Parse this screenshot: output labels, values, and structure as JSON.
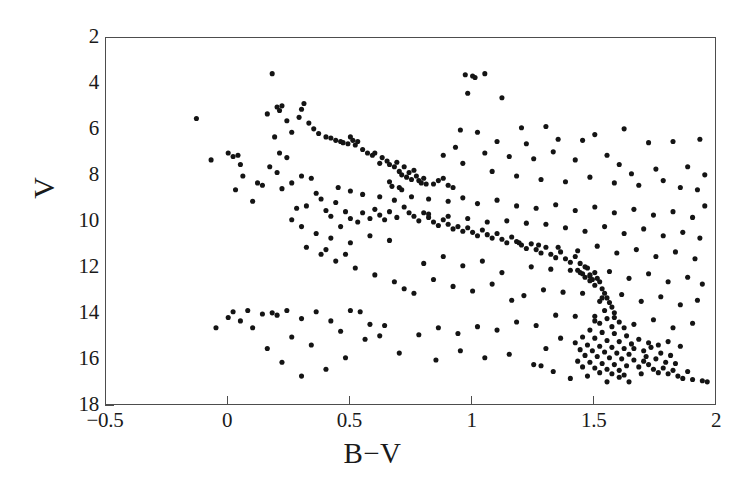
{
  "chart_data": {
    "type": "scatter",
    "title": "",
    "xlabel": "B−V",
    "ylabel": "V",
    "xlim": [
      -0.5,
      2.0
    ],
    "ylim": [
      18,
      2
    ],
    "y_inverted": true,
    "grid": false,
    "legend": null,
    "xticks": [
      -0.5,
      0,
      0.5,
      1,
      1.5,
      2
    ],
    "xticklabels": [
      "−0.5",
      "0",
      "0.5",
      "1",
      "1.5",
      "2"
    ],
    "yticks": [
      2,
      4,
      6,
      8,
      10,
      12,
      14,
      16,
      18
    ],
    "yticklabels": [
      "2",
      "4",
      "6",
      "8",
      "10",
      "12",
      "14",
      "16",
      "18"
    ],
    "marker": "filled-circle",
    "marker_color": "#141414",
    "marker_size_px": 4.4,
    "n_points": 392,
    "points": [
      [
        -0.13,
        5.5
      ],
      [
        -0.07,
        7.3
      ],
      [
        0.0,
        7.0
      ],
      [
        0.02,
        7.15
      ],
      [
        0.04,
        7.1
      ],
      [
        0.05,
        7.5
      ],
      [
        0.06,
        8.0
      ],
      [
        0.03,
        8.6
      ],
      [
        0.12,
        8.3
      ],
      [
        0.1,
        9.1
      ],
      [
        0.18,
        3.55
      ],
      [
        0.16,
        5.3
      ],
      [
        0.2,
        5.0
      ],
      [
        0.22,
        4.95
      ],
      [
        0.21,
        5.15
      ],
      [
        0.24,
        5.6
      ],
      [
        0.19,
        6.3
      ],
      [
        0.26,
        6.1
      ],
      [
        0.3,
        5.1
      ],
      [
        0.31,
        4.85
      ],
      [
        0.29,
        5.45
      ],
      [
        0.33,
        5.7
      ],
      [
        0.35,
        5.95
      ],
      [
        0.37,
        6.15
      ],
      [
        0.4,
        6.3
      ],
      [
        0.42,
        6.35
      ],
      [
        0.44,
        6.45
      ],
      [
        0.46,
        6.5
      ],
      [
        0.47,
        6.55
      ],
      [
        0.49,
        6.6
      ],
      [
        0.5,
        6.3
      ],
      [
        0.51,
        6.45
      ],
      [
        0.52,
        6.65
      ],
      [
        0.53,
        6.5
      ],
      [
        0.55,
        6.85
      ],
      [
        0.57,
        7.0
      ],
      [
        0.59,
        7.1
      ],
      [
        0.6,
        7.0
      ],
      [
        0.63,
        7.2
      ],
      [
        0.62,
        7.45
      ],
      [
        0.65,
        7.35
      ],
      [
        0.66,
        7.5
      ],
      [
        0.68,
        7.6
      ],
      [
        0.69,
        7.4
      ],
      [
        0.7,
        7.8
      ],
      [
        0.71,
        7.95
      ],
      [
        0.72,
        7.6
      ],
      [
        0.73,
        8.05
      ],
      [
        0.74,
        7.85
      ],
      [
        0.75,
        8.15
      ],
      [
        0.76,
        7.75
      ],
      [
        0.77,
        8.0
      ],
      [
        0.78,
        8.2
      ],
      [
        0.79,
        8.3
      ],
      [
        0.8,
        8.1
      ],
      [
        0.81,
        8.35
      ],
      [
        0.66,
        8.25
      ],
      [
        0.67,
        8.45
      ],
      [
        0.7,
        8.5
      ],
      [
        0.71,
        8.6
      ],
      [
        0.84,
        8.35
      ],
      [
        0.86,
        8.2
      ],
      [
        0.88,
        8.1
      ],
      [
        0.9,
        8.4
      ],
      [
        0.92,
        8.5
      ],
      [
        0.21,
        7.0
      ],
      [
        0.24,
        7.2
      ],
      [
        0.17,
        7.6
      ],
      [
        0.2,
        7.85
      ],
      [
        0.26,
        8.3
      ],
      [
        0.22,
        8.55
      ],
      [
        0.14,
        8.4
      ],
      [
        0.3,
        8.0
      ],
      [
        0.34,
        8.1
      ],
      [
        0.36,
        8.75
      ],
      [
        0.38,
        9.0
      ],
      [
        0.32,
        9.3
      ],
      [
        0.28,
        9.4
      ],
      [
        0.4,
        9.5
      ],
      [
        0.44,
        9.15
      ],
      [
        0.42,
        9.75
      ],
      [
        0.48,
        9.55
      ],
      [
        0.5,
        9.85
      ],
      [
        0.46,
        10.2
      ],
      [
        0.53,
        10.0
      ],
      [
        0.55,
        9.6
      ],
      [
        0.58,
        9.85
      ],
      [
        0.6,
        9.45
      ],
      [
        0.62,
        9.7
      ],
      [
        0.64,
        9.9
      ],
      [
        0.66,
        9.55
      ],
      [
        0.69,
        9.8
      ],
      [
        0.72,
        9.35
      ],
      [
        0.74,
        9.6
      ],
      [
        0.76,
        9.75
      ],
      [
        0.78,
        9.95
      ],
      [
        0.8,
        9.6
      ],
      [
        0.82,
        9.8
      ],
      [
        0.84,
        10.0
      ],
      [
        0.86,
        10.15
      ],
      [
        0.88,
        9.9
      ],
      [
        0.9,
        10.1
      ],
      [
        0.92,
        10.3
      ],
      [
        0.94,
        10.2
      ],
      [
        0.96,
        10.4
      ],
      [
        0.98,
        10.25
      ],
      [
        1.0,
        10.45
      ],
      [
        1.02,
        10.6
      ],
      [
        1.04,
        10.35
      ],
      [
        1.06,
        10.55
      ],
      [
        1.08,
        10.7
      ],
      [
        1.1,
        10.5
      ],
      [
        1.12,
        10.75
      ],
      [
        1.14,
        10.9
      ],
      [
        1.16,
        10.65
      ],
      [
        1.18,
        10.85
      ],
      [
        1.2,
        11.0
      ],
      [
        1.22,
        11.15
      ],
      [
        1.24,
        10.95
      ],
      [
        1.26,
        11.2
      ],
      [
        1.28,
        11.35
      ],
      [
        1.3,
        11.1
      ],
      [
        1.32,
        11.4
      ],
      [
        1.34,
        11.55
      ],
      [
        1.36,
        11.3
      ],
      [
        1.38,
        11.6
      ],
      [
        1.4,
        11.75
      ],
      [
        1.42,
        11.5
      ],
      [
        1.44,
        11.8
      ],
      [
        1.46,
        11.95
      ],
      [
        1.43,
        12.1
      ],
      [
        1.45,
        12.25
      ],
      [
        1.47,
        12.0
      ],
      [
        1.48,
        12.35
      ],
      [
        1.49,
        12.5
      ],
      [
        1.5,
        12.2
      ],
      [
        1.51,
        12.45
      ],
      [
        1.52,
        12.6
      ],
      [
        1.5,
        12.75
      ],
      [
        1.48,
        12.55
      ],
      [
        1.46,
        12.4
      ],
      [
        1.44,
        12.2
      ],
      [
        1.53,
        12.9
      ],
      [
        1.54,
        13.1
      ],
      [
        1.55,
        13.3
      ],
      [
        1.52,
        13.45
      ],
      [
        1.56,
        13.5
      ],
      [
        1.57,
        13.7
      ],
      [
        1.54,
        13.85
      ],
      [
        1.58,
        13.95
      ],
      [
        1.5,
        14.1
      ],
      [
        1.55,
        14.2
      ],
      [
        1.6,
        14.35
      ],
      [
        1.52,
        14.4
      ],
      [
        1.57,
        14.55
      ],
      [
        1.62,
        14.6
      ],
      [
        1.48,
        14.7
      ],
      [
        1.53,
        14.8
      ],
      [
        1.58,
        14.85
      ],
      [
        1.63,
        14.95
      ],
      [
        1.45,
        15.0
      ],
      [
        1.5,
        15.05
      ],
      [
        1.55,
        15.15
      ],
      [
        1.6,
        15.2
      ],
      [
        1.65,
        15.3
      ],
      [
        1.42,
        15.25
      ],
      [
        1.47,
        15.35
      ],
      [
        1.52,
        15.4
      ],
      [
        1.57,
        15.45
      ],
      [
        1.62,
        15.5
      ],
      [
        1.44,
        15.55
      ],
      [
        1.49,
        15.6
      ],
      [
        1.54,
        15.65
      ],
      [
        1.59,
        15.7
      ],
      [
        1.64,
        15.75
      ],
      [
        1.46,
        15.8
      ],
      [
        1.51,
        15.85
      ],
      [
        1.56,
        15.9
      ],
      [
        1.61,
        15.95
      ],
      [
        1.66,
        16.0
      ],
      [
        1.43,
        16.05
      ],
      [
        1.48,
        16.1
      ],
      [
        1.53,
        16.15
      ],
      [
        1.58,
        16.2
      ],
      [
        1.63,
        16.25
      ],
      [
        1.45,
        16.3
      ],
      [
        1.5,
        16.35
      ],
      [
        1.55,
        16.4
      ],
      [
        1.6,
        16.45
      ],
      [
        1.68,
        16.3
      ],
      [
        1.52,
        16.55
      ],
      [
        1.57,
        16.6
      ],
      [
        1.62,
        16.65
      ],
      [
        1.47,
        16.7
      ],
      [
        1.7,
        16.05
      ],
      [
        1.72,
        16.2
      ],
      [
        1.74,
        16.4
      ],
      [
        1.76,
        16.55
      ],
      [
        1.78,
        16.35
      ],
      [
        1.8,
        16.6
      ],
      [
        1.82,
        16.45
      ],
      [
        1.84,
        16.7
      ],
      [
        1.86,
        16.8
      ],
      [
        1.9,
        16.85
      ],
      [
        1.94,
        16.9
      ],
      [
        1.71,
        15.85
      ],
      [
        1.75,
        15.95
      ],
      [
        1.79,
        16.1
      ],
      [
        1.83,
        16.15
      ],
      [
        1.88,
        16.5
      ],
      [
        1.66,
        15.5
      ],
      [
        1.7,
        15.6
      ],
      [
        1.73,
        15.45
      ],
      [
        1.77,
        15.7
      ],
      [
        1.81,
        15.8
      ],
      [
        1.68,
        15.1
      ],
      [
        1.72,
        15.25
      ],
      [
        1.76,
        15.35
      ],
      [
        1.8,
        15.2
      ],
      [
        1.85,
        15.4
      ],
      [
        0.97,
        3.6
      ],
      [
        1.0,
        3.65
      ],
      [
        1.01,
        3.72
      ],
      [
        1.05,
        3.55
      ],
      [
        0.98,
        4.4
      ],
      [
        1.12,
        4.6
      ],
      [
        0.95,
        6.0
      ],
      [
        1.02,
        6.1
      ],
      [
        1.2,
        5.9
      ],
      [
        1.3,
        5.85
      ],
      [
        1.1,
        6.5
      ],
      [
        1.22,
        6.6
      ],
      [
        1.35,
        6.4
      ],
      [
        1.45,
        6.45
      ],
      [
        1.5,
        6.2
      ],
      [
        1.62,
        5.95
      ],
      [
        1.72,
        6.55
      ],
      [
        1.82,
        6.5
      ],
      [
        1.93,
        6.4
      ],
      [
        1.05,
        7.0
      ],
      [
        1.15,
        7.15
      ],
      [
        1.25,
        7.25
      ],
      [
        1.33,
        6.95
      ],
      [
        1.42,
        7.3
      ],
      [
        1.55,
        7.1
      ],
      [
        1.6,
        7.5
      ],
      [
        1.65,
        7.9
      ],
      [
        1.75,
        7.7
      ],
      [
        1.88,
        7.6
      ],
      [
        1.95,
        7.95
      ],
      [
        0.96,
        7.45
      ],
      [
        0.88,
        7.1
      ],
      [
        0.93,
        6.75
      ],
      [
        1.08,
        7.8
      ],
      [
        1.18,
        8.0
      ],
      [
        1.28,
        8.15
      ],
      [
        1.38,
        8.25
      ],
      [
        1.48,
        8.05
      ],
      [
        1.58,
        8.3
      ],
      [
        1.68,
        8.4
      ],
      [
        1.78,
        8.2
      ],
      [
        1.85,
        8.5
      ],
      [
        1.92,
        8.6
      ],
      [
        0.62,
        8.9
      ],
      [
        0.68,
        9.05
      ],
      [
        0.55,
        8.8
      ],
      [
        0.5,
        8.65
      ],
      [
        0.45,
        8.5
      ],
      [
        0.75,
        8.9
      ],
      [
        0.82,
        9.0
      ],
      [
        0.9,
        9.1
      ],
      [
        0.96,
        8.95
      ],
      [
        1.02,
        9.2
      ],
      [
        1.1,
        9.05
      ],
      [
        1.18,
        9.3
      ],
      [
        1.26,
        9.4
      ],
      [
        1.34,
        9.25
      ],
      [
        1.42,
        9.5
      ],
      [
        1.5,
        9.35
      ],
      [
        1.58,
        9.6
      ],
      [
        1.66,
        9.45
      ],
      [
        1.74,
        9.7
      ],
      [
        1.82,
        9.55
      ],
      [
        1.9,
        9.8
      ],
      [
        1.95,
        9.3
      ],
      [
        1.3,
        10.1
      ],
      [
        1.38,
        10.25
      ],
      [
        1.46,
        10.4
      ],
      [
        1.54,
        10.2
      ],
      [
        1.62,
        10.5
      ],
      [
        1.7,
        10.3
      ],
      [
        1.78,
        10.6
      ],
      [
        1.86,
        10.45
      ],
      [
        1.93,
        10.7
      ],
      [
        1.22,
        10.05
      ],
      [
        1.14,
        9.95
      ],
      [
        1.06,
        10.0
      ],
      [
        0.98,
        9.85
      ],
      [
        0.9,
        9.75
      ],
      [
        0.82,
        9.65
      ],
      [
        1.35,
        11.1
      ],
      [
        1.43,
        11.25
      ],
      [
        1.51,
        11.05
      ],
      [
        1.59,
        11.35
      ],
      [
        1.67,
        11.2
      ],
      [
        1.75,
        11.5
      ],
      [
        1.83,
        11.3
      ],
      [
        1.91,
        11.6
      ],
      [
        1.27,
        11.0
      ],
      [
        1.19,
        10.9
      ],
      [
        1.4,
        12.1
      ],
      [
        1.48,
        12.3
      ],
      [
        1.56,
        12.15
      ],
      [
        1.64,
        12.45
      ],
      [
        1.72,
        12.25
      ],
      [
        1.8,
        12.6
      ],
      [
        1.88,
        12.4
      ],
      [
        1.94,
        12.7
      ],
      [
        1.32,
        12.05
      ],
      [
        1.24,
        11.95
      ],
      [
        1.45,
        13.1
      ],
      [
        1.53,
        13.3
      ],
      [
        1.61,
        13.15
      ],
      [
        1.69,
        13.45
      ],
      [
        1.77,
        13.25
      ],
      [
        1.85,
        13.6
      ],
      [
        1.92,
        13.4
      ],
      [
        1.37,
        13.05
      ],
      [
        1.29,
        12.95
      ],
      [
        1.21,
        13.2
      ],
      [
        1.42,
        14.1
      ],
      [
        1.5,
        14.3
      ],
      [
        1.58,
        14.15
      ],
      [
        1.66,
        14.45
      ],
      [
        1.74,
        14.25
      ],
      [
        1.82,
        14.6
      ],
      [
        1.9,
        14.4
      ],
      [
        1.34,
        14.05
      ],
      [
        1.26,
        14.5
      ],
      [
        1.18,
        14.35
      ],
      [
        1.1,
        14.7
      ],
      [
        1.02,
        14.55
      ],
      [
        0.94,
        14.85
      ],
      [
        0.86,
        14.6
      ],
      [
        0.78,
        14.9
      ],
      [
        0.7,
        15.7
      ],
      [
        0.62,
        14.95
      ],
      [
        0.56,
        15.1
      ],
      [
        0.95,
        15.6
      ],
      [
        1.05,
        15.9
      ],
      [
        1.15,
        15.75
      ],
      [
        0.85,
        16.0
      ],
      [
        1.25,
        16.2
      ],
      [
        0.48,
        15.9
      ],
      [
        0.4,
        16.4
      ],
      [
        0.3,
        16.7
      ],
      [
        0.22,
        16.1
      ],
      [
        0.16,
        15.5
      ],
      [
        0.1,
        14.6
      ],
      [
        0.05,
        14.3
      ],
      [
        0.0,
        14.15
      ],
      [
        -0.05,
        14.6
      ],
      [
        0.02,
        13.9
      ],
      [
        0.08,
        13.85
      ],
      [
        0.14,
        14.0
      ],
      [
        0.2,
        14.05
      ],
      [
        0.3,
        14.2
      ],
      [
        0.36,
        13.9
      ],
      [
        0.42,
        14.3
      ],
      [
        0.5,
        13.85
      ],
      [
        0.54,
        13.9
      ],
      [
        0.58,
        14.45
      ],
      [
        0.64,
        14.5
      ],
      [
        0.46,
        14.75
      ],
      [
        0.26,
        15.0
      ],
      [
        0.34,
        15.35
      ],
      [
        0.18,
        13.95
      ],
      [
        0.24,
        13.85
      ],
      [
        0.68,
        12.6
      ],
      [
        0.6,
        12.3
      ],
      [
        0.52,
        12.0
      ],
      [
        0.44,
        11.7
      ],
      [
        0.38,
        11.4
      ],
      [
        0.72,
        12.9
      ],
      [
        0.76,
        13.1
      ],
      [
        0.84,
        12.5
      ],
      [
        0.92,
        12.8
      ],
      [
        1.0,
        13.0
      ],
      [
        1.08,
        12.7
      ],
      [
        1.16,
        13.4
      ],
      [
        0.8,
        11.8
      ],
      [
        0.88,
        11.5
      ],
      [
        0.96,
        11.9
      ],
      [
        1.04,
        11.7
      ],
      [
        1.12,
        12.2
      ],
      [
        0.66,
        10.8
      ],
      [
        0.58,
        10.6
      ],
      [
        0.5,
        10.9
      ],
      [
        0.42,
        10.7
      ],
      [
        0.36,
        10.5
      ],
      [
        0.3,
        10.2
      ],
      [
        0.26,
        9.9
      ],
      [
        0.32,
        11.1
      ],
      [
        0.4,
        11.2
      ],
      [
        0.48,
        11.4
      ],
      [
        1.36,
        15.05
      ],
      [
        1.4,
        16.8
      ],
      [
        1.33,
        16.5
      ],
      [
        1.28,
        16.25
      ],
      [
        1.96,
        16.95
      ],
      [
        1.64,
        16.95
      ],
      [
        1.69,
        16.6
      ],
      [
        1.55,
        16.95
      ],
      [
        1.6,
        16.75
      ],
      [
        1.3,
        15.5
      ]
    ]
  },
  "axes": {
    "x_title": "B−V",
    "y_title": "V",
    "x_tick_labels": [
      "−0.5",
      "0",
      "0.5",
      "1",
      "1.5",
      "2"
    ],
    "y_tick_labels": [
      "2",
      "4",
      "6",
      "8",
      "10",
      "12",
      "14",
      "16",
      "18"
    ]
  },
  "colors": {
    "marker": "#141414",
    "frame": "#4d4d4d",
    "background": "#ffffff",
    "text": "#1a1a1a"
  }
}
